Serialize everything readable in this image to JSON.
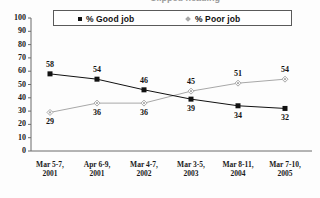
{
  "title": {
    "text": "Clipped heading",
    "visible_fragment": true
  },
  "legend": {
    "position": "top",
    "entries": [
      {
        "label": "% Good job",
        "marker": "filled-square-marker",
        "color": "#111111"
      },
      {
        "label": "% Poor job",
        "marker": "diamond-marker",
        "color": "#a8a8a8"
      }
    ]
  },
  "chart_data": {
    "type": "line",
    "title": "",
    "xlabel": "",
    "ylabel": "",
    "ylim": [
      0,
      100
    ],
    "yticks": [
      0,
      10,
      20,
      30,
      40,
      50,
      60,
      70,
      80,
      90,
      100
    ],
    "grid": false,
    "legend_position": "top",
    "categories": [
      "Mar 5-7,\n2001",
      "Apr 6-9,\n2001",
      "Mar 4-7,\n2002",
      "Mar 3-5,\n2003",
      "Mar 8-11,\n2004",
      "Mar 7-10,\n2005"
    ],
    "category_lines": [
      {
        "line1": "Mar 5-7,",
        "line2": "2001"
      },
      {
        "line1": "Apr 6-9,",
        "line2": "2001"
      },
      {
        "line1": "Mar 4-7,",
        "line2": "2002"
      },
      {
        "line1": "Mar 3-5,",
        "line2": "2003"
      },
      {
        "line1": "Mar 8-11,",
        "line2": "2004"
      },
      {
        "line1": "Mar 7-10,",
        "line2": "2005"
      }
    ],
    "series": [
      {
        "name": "% Good job",
        "color": "#111111",
        "marker": "square",
        "values": [
          58,
          54,
          46,
          39,
          34,
          32
        ]
      },
      {
        "name": "% Poor job",
        "color": "#a8a8a8",
        "marker": "diamond",
        "values": [
          29,
          36,
          36,
          45,
          51,
          54
        ]
      }
    ]
  },
  "ytick_labels": [
    "100",
    "90",
    "80",
    "70",
    "60",
    "50",
    "40",
    "30",
    "20",
    "10",
    "0"
  ],
  "point_labels": {
    "good": [
      "58",
      "54",
      "46",
      "39",
      "34",
      "32"
    ],
    "poor": [
      "29",
      "36",
      "36",
      "45",
      "51",
      "54"
    ]
  }
}
